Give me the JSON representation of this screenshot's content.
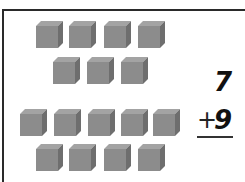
{
  "worksheet": {
    "problem": {
      "top_number": "7",
      "operator": "+",
      "bottom_number": "9",
      "answer": ""
    },
    "groups": [
      {
        "name": "first-addend-cubes",
        "count": 7,
        "rows": [
          4,
          3
        ]
      },
      {
        "name": "second-addend-cubes",
        "count": 9,
        "rows": [
          5,
          4
        ]
      }
    ],
    "colors": {
      "cube_front": "#8a8a8a",
      "cube_top": "#9c9c9c",
      "cube_side": "#6c6c6c",
      "ink": "#111111"
    }
  }
}
